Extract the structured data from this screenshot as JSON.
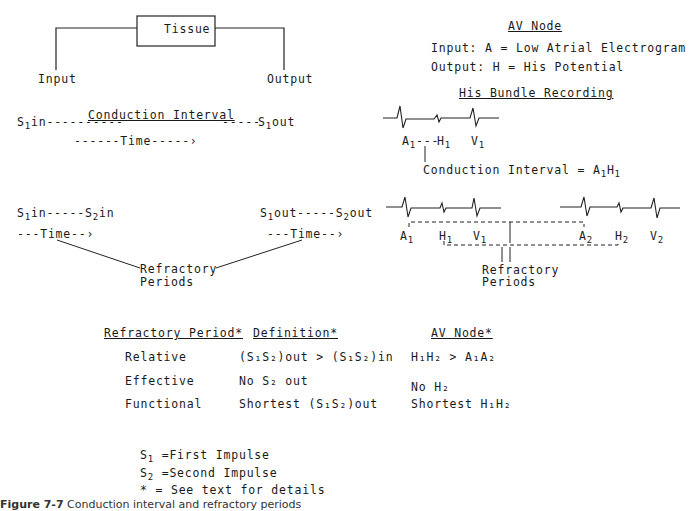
{
  "tissue_block": {
    "box_label": "Tissue",
    "input_label": "Input",
    "output_label": "Output"
  },
  "conduction": {
    "s1_in": "S",
    "s1_in_sub": "1",
    "s1_in_suffix": "in",
    "dashes_left": "----------",
    "interval_label": "Conduction Interval",
    "dashes_right": "-----",
    "s1_out": "S",
    "s1_out_sub": "1",
    "s1_out_suffix": "out",
    "time_label": "------Time-----›"
  },
  "refractory_left": {
    "s1": "S",
    "s1_sub": "1",
    "s1_suffix": "in-----",
    "s2": "S",
    "s2_sub": "2",
    "s2_suffix": "in",
    "time_label": "---Time--›"
  },
  "refractory_right": {
    "s1": "S",
    "s1_sub": "1",
    "s1_suffix": "out-----",
    "s2": "S",
    "s2_sub": "2",
    "s2_suffix": "out",
    "time_label": "---Time--›"
  },
  "refractory_periods_label": [
    "Refractory",
    "Periods"
  ],
  "av_node": {
    "title": "AV Node",
    "input_line": "Input: A = Low Atrial Electrogram",
    "output_line": "Output: H = His Potential"
  },
  "his_bundle": {
    "title": "His Bundle Recording",
    "single_beat_labels": [
      {
        "letter": "A",
        "sub": "1"
      },
      {
        "letter": "H",
        "sub": "1"
      },
      {
        "letter": "V",
        "sub": "1"
      }
    ],
    "a_h_dashes": "---",
    "conduction_interval_text": "Conduction Interval = A",
    "conduction_interval_sub1": "1",
    "conduction_interval_h": "H",
    "conduction_interval_sub2": "1",
    "two_beat_labels": [
      {
        "letter": "A",
        "sub": "1"
      },
      {
        "letter": "H",
        "sub": "1"
      },
      {
        "letter": "V",
        "sub": "1"
      },
      {
        "letter": "A",
        "sub": "2"
      },
      {
        "letter": "H",
        "sub": "2"
      },
      {
        "letter": "V",
        "sub": "2"
      }
    ],
    "refractory_label": [
      "Refractory",
      "Periods"
    ]
  },
  "table": {
    "headers": [
      "Refractory Period*",
      "Definition*",
      "AV Node*"
    ],
    "rows": [
      {
        "period": "Relative",
        "definition": "(S₁S₂)out > (S₁S₂)in",
        "av_node": "H₁H₂ > A₁A₂"
      },
      {
        "period": "Effective",
        "definition": "No S₂ out",
        "av_node": "No H₂"
      },
      {
        "period": "Functional",
        "definition": "Shortest (S₁S₂)out",
        "av_node": "Shortest H₁H₂"
      }
    ]
  },
  "legend": [
    {
      "sym": "S",
      "sub": "1",
      "text": " =First Impulse"
    },
    {
      "sym": "S",
      "sub": "2",
      "text": " =Second Impulse"
    },
    {
      "sym": "*",
      "sub": "",
      "text": " = See text for details"
    }
  ],
  "caption": {
    "label": "Figure 7-7",
    "text": "Conduction interval and refractory periods"
  }
}
